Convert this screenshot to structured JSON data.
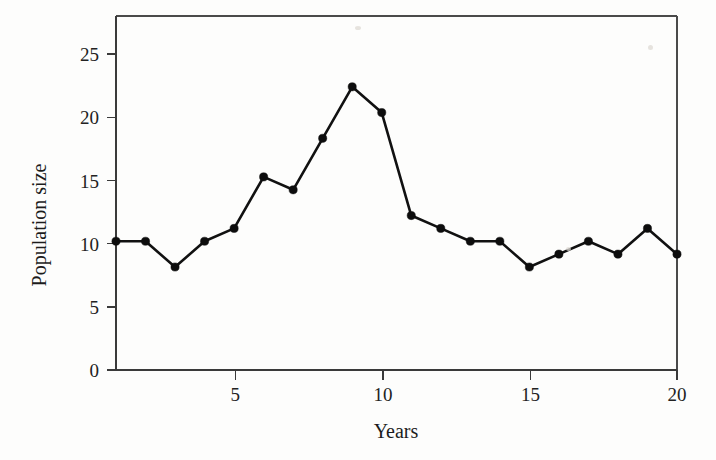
{
  "chart_data": {
    "type": "line",
    "title": "",
    "xlabel": "Years",
    "ylabel": "Population size",
    "x": [
      1,
      2,
      3,
      4,
      5,
      6,
      7,
      8,
      9,
      10,
      11,
      12,
      13,
      14,
      15,
      16,
      17,
      18,
      19,
      20
    ],
    "values": [
      10,
      10,
      8,
      10,
      11,
      15,
      14,
      18,
      22,
      20,
      12,
      11,
      10,
      10,
      8,
      9,
      10,
      9,
      11,
      9
    ],
    "series": [
      {
        "name": "Population size",
        "values": [
          10,
          10,
          8,
          10,
          11,
          15,
          14,
          18,
          22,
          20,
          12,
          11,
          10,
          10,
          8,
          9,
          10,
          9,
          11,
          9
        ]
      }
    ],
    "xlim": [
      1,
      20
    ],
    "ylim": [
      0,
      27.5
    ],
    "xticks": [
      5,
      10,
      15,
      20
    ],
    "xtick_labels": [
      "5",
      "10",
      "15",
      "20"
    ],
    "yticks": [
      0,
      5,
      10,
      15,
      20,
      25
    ],
    "ytick_labels": [
      "0",
      "5",
      "10",
      "15",
      "20",
      "25"
    ],
    "grid": false,
    "legend": false,
    "legend_position": "none",
    "marker": "filled-circle",
    "line_color": "#111111",
    "marker_color": "#0d0d0d",
    "background_color": "#fdfdfc",
    "axis_color": "#3a3a3a"
  },
  "axes": {
    "y_title": "Population size",
    "x_title": "Years"
  }
}
